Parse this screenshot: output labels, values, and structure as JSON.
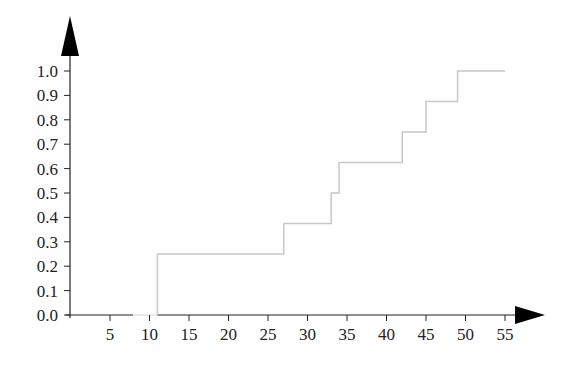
{
  "chart_data": {
    "type": "line",
    "subtype": "step (empirical CDF)",
    "title": "",
    "xlabel": "",
    "ylabel": "",
    "xlim": [
      0,
      55
    ],
    "ylim": [
      0,
      1.0
    ],
    "grid": false,
    "legend": null,
    "x_ticks": [
      5,
      10,
      15,
      20,
      25,
      30,
      35,
      40,
      45,
      50,
      55
    ],
    "y_ticks": [
      "0.0",
      "0.1",
      "0.2",
      "0.3",
      "0.4",
      "0.5",
      "0.6",
      "0.7",
      "0.8",
      "0.9",
      "1.0"
    ],
    "steps": [
      {
        "x_start": 0,
        "x_end": 11,
        "y": 0.0
      },
      {
        "x_start": 11,
        "x_end": 27,
        "y": 0.25
      },
      {
        "x_start": 27,
        "x_end": 33,
        "y": 0.375
      },
      {
        "x_start": 33,
        "x_end": 34,
        "y": 0.5
      },
      {
        "x_start": 34,
        "x_end": 42,
        "y": 0.625
      },
      {
        "x_start": 42,
        "x_end": 45,
        "y": 0.75
      },
      {
        "x_start": 45,
        "x_end": 49,
        "y": 0.875
      },
      {
        "x_start": 49,
        "x_end": 55,
        "y": 1.0
      }
    ],
    "jump_points": [
      11,
      27,
      33,
      34,
      42,
      45,
      49
    ],
    "series": [
      {
        "name": "ECDF",
        "x": [
          0,
          11,
          11,
          27,
          27,
          33,
          33,
          34,
          34,
          42,
          42,
          45,
          45,
          49,
          49,
          55
        ],
        "y": [
          0,
          0,
          0.25,
          0.25,
          0.375,
          0.375,
          0.5,
          0.5,
          0.625,
          0.625,
          0.75,
          0.75,
          0.875,
          0.875,
          1.0,
          1.0
        ]
      }
    ],
    "colors": {
      "axis": "#222222",
      "step_line": "#c8c8c8"
    }
  }
}
